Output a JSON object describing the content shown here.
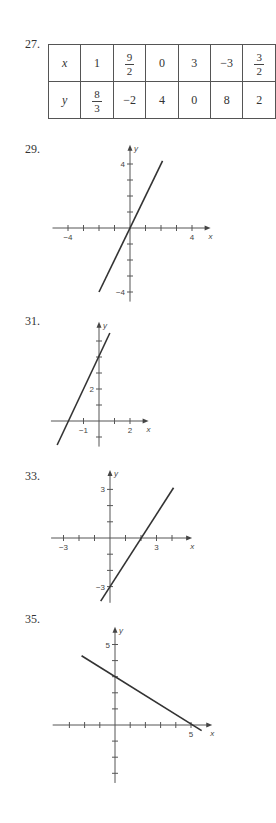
{
  "problems": [
    {
      "number": "27.",
      "type": "table"
    },
    {
      "number": "29.",
      "type": "graph"
    },
    {
      "number": "31.",
      "type": "graph"
    },
    {
      "number": "33.",
      "type": "graph"
    },
    {
      "number": "35.",
      "type": "graph"
    }
  ],
  "table": {
    "row_x": {
      "label": "x",
      "cells": [
        {
          "text": "1"
        },
        {
          "num": "9",
          "den": "2"
        },
        {
          "text": "0"
        },
        {
          "text": "3"
        },
        {
          "text": "−3"
        },
        {
          "num": "3",
          "den": "2"
        }
      ]
    },
    "row_y": {
      "label": "y",
      "cells": [
        {
          "num": "8",
          "den": "3"
        },
        {
          "text": "−2"
        },
        {
          "text": "4"
        },
        {
          "text": "0"
        },
        {
          "text": "8"
        },
        {
          "text": "2"
        }
      ]
    }
  },
  "chart_data": [
    {
      "id": "29",
      "type": "line",
      "title": "29.",
      "xlabel": "x",
      "ylabel": "y",
      "equation": "y = 2x",
      "origin_px": [
        130,
        228
      ],
      "unit_px": [
        15.5,
        16
      ],
      "x_axis_range": [
        -5,
        5.2
      ],
      "y_axis_range": [
        -4.6,
        5.2
      ],
      "x_ticks": [
        -4,
        -3,
        -2,
        -1,
        1,
        2,
        3,
        4
      ],
      "y_ticks": [
        -4,
        -3,
        -2,
        -1,
        1,
        2,
        3,
        4
      ],
      "x_tick_labels": [
        {
          "value": -4,
          "text": "−4"
        },
        {
          "value": 4,
          "text": "4"
        }
      ],
      "y_tick_labels": [
        {
          "value": 4,
          "text": "4"
        },
        {
          "value": -4,
          "text": "−4"
        }
      ],
      "segment": [
        [
          -2,
          -4
        ],
        [
          2.1,
          4.2
        ]
      ],
      "grid": false
    },
    {
      "id": "31",
      "type": "line",
      "title": "31.",
      "xlabel": "x",
      "ylabel": "y",
      "equation": "y = 2x + 4",
      "origin_px": [
        99,
        421
      ],
      "unit_px": [
        15.5,
        16
      ],
      "x_axis_range": [
        -3.1,
        3.2
      ],
      "y_axis_range": [
        -1.6,
        6.2
      ],
      "x_ticks": [
        -1,
        1,
        2
      ],
      "y_ticks": [
        -1,
        1,
        2,
        3,
        4,
        5
      ],
      "x_tick_labels": [
        {
          "value": -1,
          "text": "−1"
        },
        {
          "value": 2,
          "text": "2"
        }
      ],
      "y_tick_labels": [
        {
          "value": 2,
          "text": "2"
        }
      ],
      "segment": [
        [
          -2.7,
          -1.5
        ],
        [
          0.7,
          5.5
        ]
      ],
      "grid": false
    },
    {
      "id": "33",
      "type": "line",
      "title": "33.",
      "xlabel": "x",
      "ylabel": "y",
      "equation": "y = 1.5x − 3",
      "origin_px": [
        110,
        538
      ],
      "unit_px": [
        15.5,
        16.2
      ],
      "x_axis_range": [
        -3.8,
        5.3
      ],
      "y_axis_range": [
        -4,
        4.2
      ],
      "x_ticks": [
        -3,
        -2,
        -1,
        1,
        2,
        3,
        4
      ],
      "y_ticks": [
        -3,
        -2,
        -1,
        1,
        2,
        3
      ],
      "x_tick_labels": [
        {
          "value": -3,
          "text": "−3"
        },
        {
          "value": 3,
          "text": "3"
        }
      ],
      "y_tick_labels": [
        {
          "value": 3,
          "text": "3"
        },
        {
          "value": -3,
          "text": "−3"
        }
      ],
      "segment": [
        [
          -0.6,
          -3.9
        ],
        [
          4.1,
          3.1
        ]
      ],
      "grid": false
    },
    {
      "id": "35",
      "type": "line",
      "title": "35.",
      "xlabel": "x",
      "ylabel": "y",
      "equation": "y = −0.6x + 3",
      "origin_px": [
        115,
        725
      ],
      "unit_px": [
        15.2,
        16.1
      ],
      "x_axis_range": [
        -4.1,
        6.4
      ],
      "y_axis_range": [
        -3.6,
        6.1
      ],
      "x_ticks": [
        -3,
        -2,
        -1,
        1,
        2,
        3,
        4,
        5
      ],
      "y_ticks": [
        -3,
        -2,
        -1,
        1,
        2,
        3,
        4,
        5
      ],
      "x_tick_labels": [
        {
          "value": 5,
          "text": "5"
        }
      ],
      "y_tick_labels": [
        {
          "value": 5,
          "text": "5"
        }
      ],
      "segment": [
        [
          -2.2,
          4.3
        ],
        [
          5.7,
          -0.35
        ]
      ],
      "grid": false
    }
  ]
}
